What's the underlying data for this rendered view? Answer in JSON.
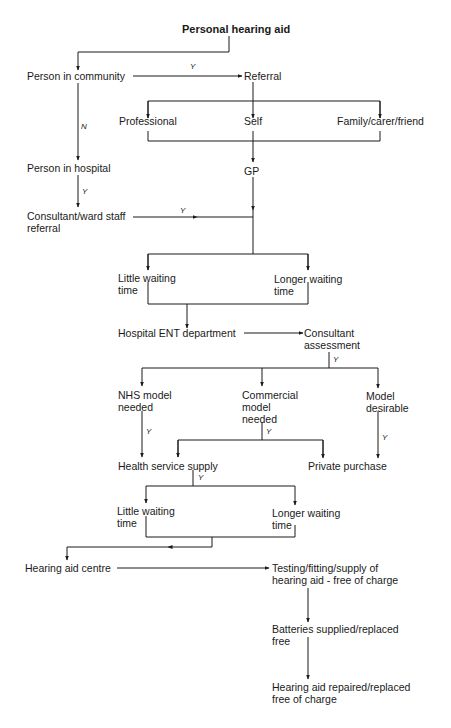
{
  "diagram": {
    "title": "Personal hearing aid",
    "nodes": {
      "community": "Person in community",
      "referral": "Referral",
      "professional": "Professional",
      "self": "Self",
      "family": "Family/carer/friend",
      "hospital": "Person in hospital",
      "gp": "GP",
      "consultant_ref_1": "Consultant/ward staff",
      "consultant_ref_2": "referral",
      "little_wait_1a": "Little waiting",
      "little_wait_1b": "time",
      "longer_wait_1a": "Longer waiting",
      "longer_wait_1b": "time",
      "ent": "Hospital ENT department",
      "assess_1": "Consultant",
      "assess_2": "assessment",
      "nhs_1": "NHS model",
      "nhs_2": "needed",
      "commercial_1": "Commercial",
      "commercial_2": "model",
      "commercial_3": "needed",
      "desirable_1": "Model",
      "desirable_2": "desirable",
      "health_supply": "Health service supply",
      "private": "Private purchase",
      "little_wait_2a": "Little waiting",
      "little_wait_2b": "time",
      "longer_wait_2a": "Longer waiting",
      "longer_wait_2b": "time",
      "centre": "Hearing aid centre",
      "testing_1": "Testing/fitting/supply of",
      "testing_2": "hearing aid - free of charge",
      "batteries_1": "Batteries supplied/replaced",
      "batteries_2": "free",
      "repaired_1": "Hearing aid repaired/replaced",
      "repaired_2": "free of charge"
    },
    "edge_labels": {
      "yes": "Y",
      "no": "N"
    }
  }
}
